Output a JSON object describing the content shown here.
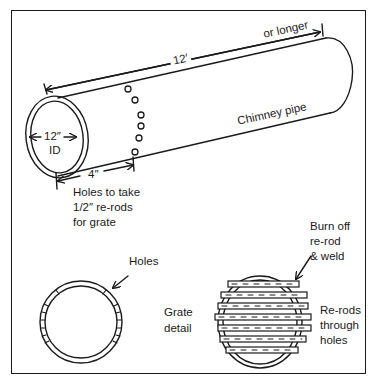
{
  "diagram": {
    "labels": {
      "length_main": "12′",
      "length_extra": "or longer",
      "pipe_name": "Chimney pipe",
      "inner_diameter_value": "12″",
      "inner_diameter_unit": "ID",
      "hole_offset": "4″",
      "holes_note_line1": "Holes to take",
      "holes_note_line2": "1/2″ re-rods",
      "holes_note_line3": "for grate",
      "holes": "Holes",
      "grate_detail_line1": "Grate",
      "grate_detail_line2": "detail",
      "burn_off_line1": "Burn off",
      "burn_off_line2": "re-rod",
      "burn_off_line3": "& weld",
      "rerods_line1": "Re-rods",
      "rerods_line2": "through",
      "rerods_line3": "holes"
    },
    "colors": {
      "ink": "#1a1a1a",
      "background": "#ffffff"
    }
  }
}
